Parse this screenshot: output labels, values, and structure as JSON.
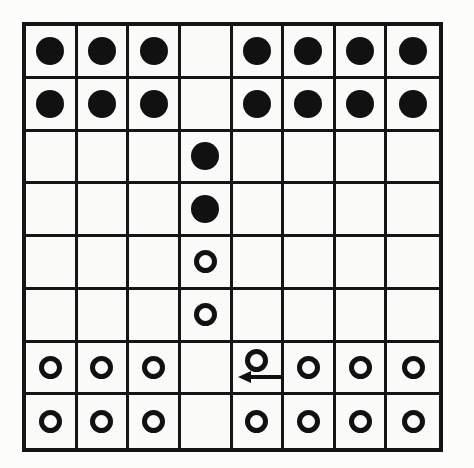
{
  "figure": {
    "title": "Eight by eight puzzle board with black and white pieces",
    "board_label": "game-board",
    "rows": 8,
    "columns": 8,
    "colors": {
      "line": "#111111",
      "black_piece": "#111111",
      "white_piece_stroke": "#111111",
      "background": "#fafaf8"
    }
  },
  "legend": {
    "black_label": "black piece",
    "white_label": "white piece",
    "empty_label": "empty cell",
    "arrow_label": "move arrow pointing left"
  },
  "board": {
    "cells": [
      [
        "black",
        "black",
        "black",
        "empty",
        "black",
        "black",
        "black",
        "black"
      ],
      [
        "black",
        "black",
        "black",
        "empty",
        "black",
        "black",
        "black",
        "black"
      ],
      [
        "empty",
        "empty",
        "empty",
        "black",
        "empty",
        "empty",
        "empty",
        "empty"
      ],
      [
        "empty",
        "empty",
        "empty",
        "black",
        "empty",
        "empty",
        "empty",
        "empty"
      ],
      [
        "empty",
        "empty",
        "empty",
        "white",
        "empty",
        "empty",
        "empty",
        "empty"
      ],
      [
        "empty",
        "empty",
        "empty",
        "white",
        "empty",
        "empty",
        "empty",
        "empty"
      ],
      [
        "white",
        "white",
        "white",
        "empty",
        "white",
        "white",
        "white",
        "white"
      ],
      [
        "white",
        "white",
        "white",
        "empty",
        "white",
        "white",
        "white",
        "white"
      ]
    ],
    "arrow": {
      "row": 6,
      "column": 4,
      "direction": "left"
    }
  }
}
